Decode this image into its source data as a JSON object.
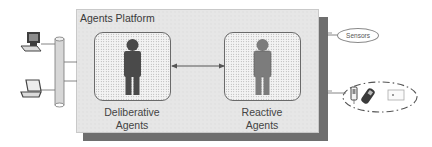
{
  "diagram": {
    "platform": {
      "title": "Agents Platform"
    },
    "agents": [
      {
        "id": "deliberative",
        "label_line1": "Deliberative",
        "label_line2": "Agents",
        "figure_color": "#4a4a4a"
      },
      {
        "id": "reactive",
        "label_line1": "Reactive",
        "label_line2": "Agents",
        "figure_color": "#7c7c7c"
      }
    ],
    "connection": {
      "type": "bidirectional-arrow",
      "between": [
        "deliberative",
        "reactive"
      ]
    },
    "left_clients": [
      {
        "icon": "desktop-computer-icon"
      },
      {
        "icon": "laptop-icon"
      }
    ],
    "bus": {
      "icon": "network-bus-cylinder-icon"
    },
    "right_peripherals": {
      "sensors": {
        "label": "Sensors"
      },
      "devices_group": {
        "style": "dash-dot-ellipse",
        "devices": [
          {
            "icon": "pda-icon"
          },
          {
            "icon": "mobile-phone-icon"
          },
          {
            "icon": "card-reader-icon"
          }
        ]
      }
    },
    "colors": {
      "platform_bg": "#e6e6e6",
      "platform_shadow": "#6e6e6e",
      "tile_border": "#6a6a6a",
      "text": "#444444"
    }
  }
}
